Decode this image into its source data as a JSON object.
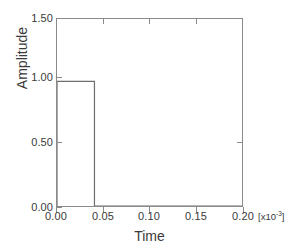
{
  "chart_data": {
    "type": "line",
    "title": "",
    "subtitle": "",
    "xlabel": "Time",
    "ylabel": "Amplitude",
    "xlim": [
      0.0,
      0.2
    ],
    "ylim": [
      0.0,
      1.5
    ],
    "grid": false,
    "legend": null,
    "x_scale_prefix": "[x10",
    "x_scale_exponent": "-3",
    "x_scale_suffix": "]",
    "xticks": [
      0.0,
      0.05,
      0.1,
      0.15,
      0.2
    ],
    "xticklabels": [
      "0.00",
      "0.05",
      "0.10",
      "0.15",
      "0.20"
    ],
    "yticks": [
      0.0,
      0.5,
      1.0,
      1.5
    ],
    "yticklabels": [
      "0.00",
      "0.50",
      "1.00",
      "1.50"
    ],
    "series": [
      {
        "name": "pulse",
        "color": "#6e6e6e",
        "x": [
          0.0,
          0.0,
          0.0405,
          0.0405,
          0.2
        ],
        "y": [
          0.0,
          1.0,
          1.0,
          0.0,
          0.0
        ],
        "description": "rectangular pulse of amplitude 1.00 from t=0 to t=0.0405"
      }
    ],
    "annotations": []
  },
  "style": {
    "background": "#ffffff",
    "axis_color": "#8a8a8a",
    "text_color": "#3a3a3a",
    "line_color": "#6e6e6e"
  }
}
